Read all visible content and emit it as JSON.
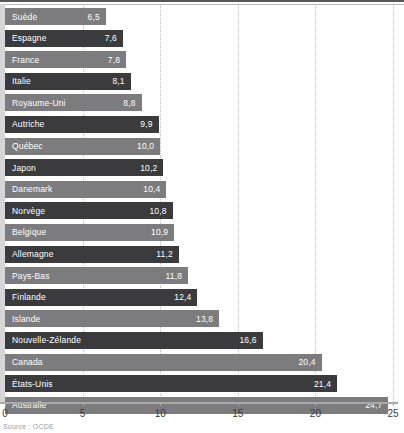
{
  "chart_data": {
    "type": "bar",
    "orientation": "horizontal",
    "title": "",
    "subtitle": "",
    "xlabel": "",
    "ylabel": "",
    "xlim": [
      0,
      25
    ],
    "xticks": [
      0,
      5,
      10,
      15,
      20,
      25
    ],
    "xtick_labels": [
      "0",
      "5",
      "10",
      "15",
      "20",
      "25"
    ],
    "grid": "vertical-dotted",
    "gridlines_at": [
      5,
      10,
      15,
      20,
      25
    ],
    "legend": null,
    "decimal_separator": ",",
    "categories": [
      "Suède",
      "Espagne",
      "France",
      "Italie",
      "Royaume-Uni",
      "Autriche",
      "Québec",
      "Japon",
      "Danemark",
      "Norvège",
      "Belgique",
      "Allemagne",
      "Pays-Bas",
      "Finlande",
      "Islande",
      "Nouvelle-Zélande",
      "Canada",
      "États-Unis",
      "Australie"
    ],
    "values": [
      6.5,
      7.6,
      7.8,
      8.1,
      8.8,
      9.9,
      10.0,
      10.2,
      10.4,
      10.8,
      10.9,
      11.2,
      11.8,
      12.4,
      13.8,
      16.6,
      20.4,
      21.4,
      24.7
    ],
    "value_labels": [
      "6,5",
      "7,6",
      "7,8",
      "8,1",
      "8,8",
      "9,9",
      "10,0",
      "10,2",
      "10,4",
      "10,8",
      "10,9",
      "11,2",
      "11,8",
      "12,4",
      "13,8",
      "16,6",
      "20,4",
      "21,4",
      "24,7"
    ],
    "bar_styles": [
      "light",
      "dark",
      "light",
      "dark",
      "light",
      "dark",
      "light",
      "dark",
      "light",
      "dark",
      "light",
      "dark",
      "light",
      "dark",
      "light",
      "dark",
      "light",
      "dark",
      "light"
    ]
  },
  "colors": {
    "bar_light": "#7c7c7e",
    "bar_dark": "#3b3b3d",
    "gridline": "#bdbdbf",
    "axis": "#a9a9ab",
    "gutter": "#d6d6d8",
    "value_text": "#ffffff",
    "tick_text": "#3b3b3d",
    "source_text": "#9a9a9c"
  },
  "footer": {
    "source": "Source : OCDE"
  }
}
